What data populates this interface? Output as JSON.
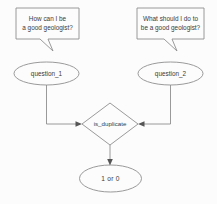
{
  "diagram": {
    "colors": {
      "background": "#fcfcfc",
      "stroke": "#8e8e8e",
      "text": "#3a3a3a",
      "arrow": "#555555"
    },
    "bubbles": [
      {
        "id": "bubble-question-1",
        "line1": "How can I be",
        "line2": "a good geologist?"
      },
      {
        "id": "bubble-question-2",
        "line1": "What should I do to",
        "line2": "be a good geologist?"
      }
    ],
    "nodes": [
      {
        "id": "node-question-1",
        "label": "question_1",
        "shape": "ellipse"
      },
      {
        "id": "node-question-2",
        "label": "question_2",
        "shape": "ellipse"
      },
      {
        "id": "node-is-duplicate",
        "label": "is_duplicate",
        "shape": "diamond"
      },
      {
        "id": "node-output",
        "label": "1 or 0",
        "shape": "ellipse"
      }
    ]
  }
}
